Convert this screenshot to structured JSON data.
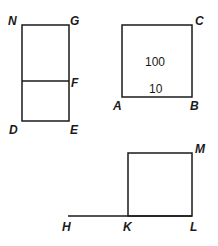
{
  "figures": {
    "rectangle_ngde": {
      "vertices": {
        "N": "N",
        "G": "G",
        "F": "F",
        "D": "D",
        "E": "E"
      }
    },
    "square_abc": {
      "vertices": {
        "A": "A",
        "B": "B",
        "C": "C"
      },
      "area_label": "100",
      "side_label": "10"
    },
    "square_klm": {
      "vertices": {
        "H": "H",
        "K": "K",
        "L": "L",
        "M": "M"
      }
    }
  },
  "colors": {
    "stroke": "#1a1a1a",
    "background": "#ffffff"
  }
}
